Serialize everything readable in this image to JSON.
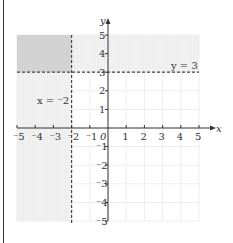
{
  "chart_data": {
    "type": "inequality-region",
    "title": "",
    "xlabel": "x",
    "ylabel": "y",
    "xlim": [
      -5,
      5
    ],
    "ylim": [
      -5,
      5
    ],
    "grid": true,
    "x_ticks": [
      "-5",
      "-4",
      "-3",
      "-2",
      "-1",
      "0",
      "1",
      "2",
      "3",
      "4",
      "5"
    ],
    "y_ticks": [
      "-5",
      "-4",
      "-3",
      "-2",
      "-1",
      "1",
      "2",
      "3",
      "4",
      "5"
    ],
    "x_tick_labels": [
      "⁻5",
      "⁻4",
      "⁻3",
      "⁻2",
      "⁻1",
      "0",
      "1",
      "2",
      "3",
      "4",
      "5"
    ],
    "y_tick_labels": [
      "⁻5",
      "⁻4",
      "⁻3",
      "⁻2",
      "⁻1",
      "1",
      "2",
      "3",
      "4",
      "5"
    ],
    "lines": [
      {
        "equation": "y = 3",
        "style": "dashed",
        "label": "y = 3"
      },
      {
        "equation": "x = -2",
        "style": "dashed",
        "label": "x = ⁻2"
      }
    ],
    "shaded_regions": [
      {
        "description": "y > 3 (shaded above y = 3)",
        "y_range": [
          3,
          5
        ],
        "x_range": [
          -5,
          5
        ]
      },
      {
        "description": "x < -2 (shaded left of x = -2)",
        "x_range": [
          -5,
          -2
        ],
        "y_range": [
          -5,
          5
        ]
      },
      {
        "description": "overlap x < -2 and y > 3 (darker)",
        "x_range": [
          -5,
          -2
        ],
        "y_range": [
          3,
          5
        ]
      }
    ]
  },
  "labels": {
    "x_axis": "x",
    "y_axis": "y",
    "line_y": "y = 3",
    "line_x": "x = ⁻2",
    "origin": "0"
  },
  "colors": {
    "overlap": "#d2d2d2",
    "single_shade": "#ececec",
    "grid": "#eeeeee",
    "axis": "#333333"
  }
}
